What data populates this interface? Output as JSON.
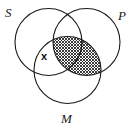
{
  "diagram": {
    "type": "venn-three-circle",
    "background_color": "#ffffff",
    "stroke_color": "#1a1a1a",
    "shading_color": "#1a1a1a",
    "circles": [
      {
        "id": "S",
        "label": "S",
        "position": "top-left",
        "cx": 48.5,
        "cy": 42,
        "r": 33.5
      },
      {
        "id": "P",
        "label": "P",
        "position": "top-right",
        "cx": 86.5,
        "cy": 42,
        "r": 33.5
      },
      {
        "id": "M",
        "label": "M",
        "position": "bottom-center",
        "cx": 67.5,
        "cy": 70,
        "r": 33.5
      }
    ],
    "shaded_regions": [
      {
        "id": "S-and-M-and-P",
        "description": "intersection of S, M and P",
        "fill": "cross-hatch"
      },
      {
        "id": "M-and-P-not-S",
        "description": "M intersect P outside S",
        "fill": "cross-hatch"
      }
    ],
    "marks": [
      {
        "id": "x-mark",
        "symbol": "x",
        "description": "individual placed in S intersect M, outside P",
        "x": 46,
        "y": 59
      }
    ],
    "labels": {
      "s": "S",
      "p": "P",
      "m": "M",
      "x": "x"
    }
  }
}
